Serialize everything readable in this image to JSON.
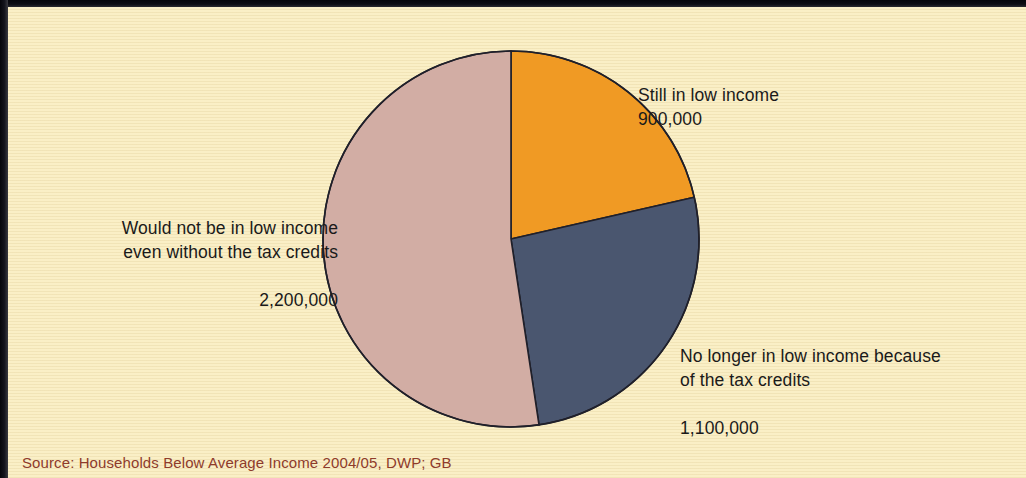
{
  "figure": {
    "background_color": "#faefc6",
    "source_note": "Source: Households Below Average Income 2004/05, DWP; GB",
    "source_color": "#8e3b2b"
  },
  "chart_data": {
    "type": "pie",
    "title": "",
    "subtitle": "",
    "unit": "households",
    "total": 4200000,
    "start_angle_deg": 0,
    "direction": "clockwise",
    "legend": "labels placed outside slices",
    "categories": [
      "Still in low income",
      "No longer in low income because of the tax credits",
      "Would not be in low income even without the tax credits"
    ],
    "values": [
      900000,
      1100000,
      2200000
    ],
    "value_labels": [
      "900,000",
      "1,100,000",
      "2,200,000"
    ],
    "colors": [
      "#f09a24",
      "#4a566f",
      "#d2ada4"
    ],
    "slices": [
      {
        "name": "still-in-low-income",
        "label_line1": "Still in low income",
        "label_line2": "",
        "value": 900000,
        "value_label": "900,000",
        "color": "#f09a24",
        "start_deg": 0,
        "end_deg": 77.14,
        "percent": 21.4
      },
      {
        "name": "no-longer-in-low-income",
        "label_line1": "No longer in low income because",
        "label_line2": "of the tax credits",
        "value": 1100000,
        "value_label": "1,100,000",
        "color": "#4a566f",
        "start_deg": 77.14,
        "end_deg": 171.43,
        "percent": 26.2
      },
      {
        "name": "would-not-be-in-low-income",
        "label_line1": "Would not be in low income",
        "label_line2": "even without the tax credits",
        "value": 2200000,
        "value_label": "2,200,000",
        "color": "#d2ada4",
        "start_deg": 171.43,
        "end_deg": 360,
        "percent": 52.4
      }
    ],
    "geometry": {
      "center_x": 503,
      "center_y": 232,
      "radius": 188,
      "stroke_color": "#20202a",
      "stroke_width": 1.6
    }
  },
  "labels": {
    "still": {
      "line1": "Still in low income",
      "value": "900,000"
    },
    "would_not": {
      "line1": "Would not be in low income",
      "line2": "even without the tax credits",
      "value": "2,200,000"
    },
    "no_longer": {
      "line1": "No longer in low income because",
      "line2": "of the tax credits",
      "value": "1,100,000"
    }
  }
}
